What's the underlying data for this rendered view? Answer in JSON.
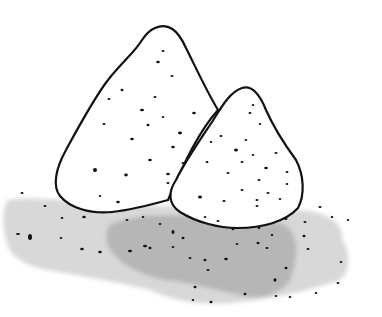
{
  "scene": {
    "description": "Hand-drawn illustration of two speckled rock piles with a gray shadow",
    "colors": {
      "background": "#ffffff",
      "outline": "#111111",
      "shadow_light": "#d6d6d6",
      "shadow_dark": "#b4b4b4",
      "speckle": "#111111"
    },
    "objects": [
      {
        "name": "large-rock"
      },
      {
        "name": "small-rock"
      },
      {
        "name": "ground-shadow"
      }
    ]
  }
}
